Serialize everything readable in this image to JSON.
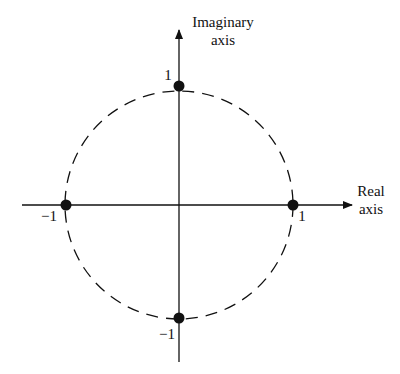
{
  "diagram": {
    "axes": {
      "imaginary": {
        "line1": "Imaginary",
        "line2": "axis"
      },
      "real": {
        "line1": "Real",
        "line2": "axis"
      }
    },
    "points": [
      {
        "label": "1",
        "position": "top"
      },
      {
        "label": "1",
        "position": "right"
      },
      {
        "label": "−1",
        "position": "left"
      },
      {
        "label": "−1",
        "position": "bottom"
      }
    ],
    "circle_style": "dashed",
    "colors": {
      "stroke": "#111111",
      "background": "#ffffff"
    }
  }
}
